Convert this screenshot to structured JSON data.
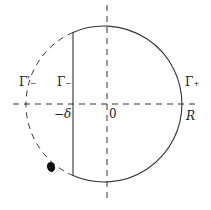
{
  "diagram": {
    "type": "contour-diagram",
    "labels": {
      "gamma_minus_prime": "Γ′₋",
      "gamma_minus": "Γ₋",
      "gamma_plus": "Γ₊",
      "minus_delta": "−δ",
      "origin": "0",
      "radius": "R"
    },
    "colors": {
      "stroke": "#333333",
      "background": "#ffffff"
    },
    "geometry": {
      "center": [
        107,
        104
      ],
      "radius": 78,
      "vertical_segment_x": 73
    }
  }
}
